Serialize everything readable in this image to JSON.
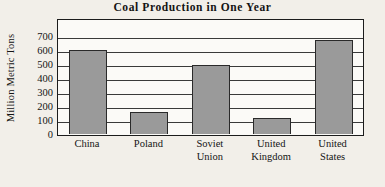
{
  "chart_data": {
    "type": "bar",
    "title": "Coal Production in One Year",
    "xlabel": "",
    "ylabel": "Million Metric Tons",
    "categories": [
      "China",
      "Poland",
      "Soviet Union",
      "United Kingdom",
      "United States"
    ],
    "category_lines": [
      [
        "China"
      ],
      [
        "Poland"
      ],
      [
        "Soviet",
        "Union"
      ],
      [
        "United",
        "Kingdom"
      ],
      [
        "United",
        "States"
      ]
    ],
    "values": [
      600,
      155,
      490,
      115,
      675
    ],
    "ylim": [
      0,
      700
    ],
    "ytick_values": [
      700,
      600,
      500,
      400,
      300,
      200,
      100,
      0
    ],
    "ytick_labels": [
      "700",
      "600",
      "500",
      "400",
      "300",
      "200",
      "100",
      "0"
    ],
    "grid": true,
    "legend": "none",
    "bar_color": "#9a9a9a",
    "bar_edge_color": "#2a2a2a",
    "axis_color": "#1c1c1c",
    "plot_background": "#fbfaf7",
    "page_background": "#f2efe9"
  }
}
